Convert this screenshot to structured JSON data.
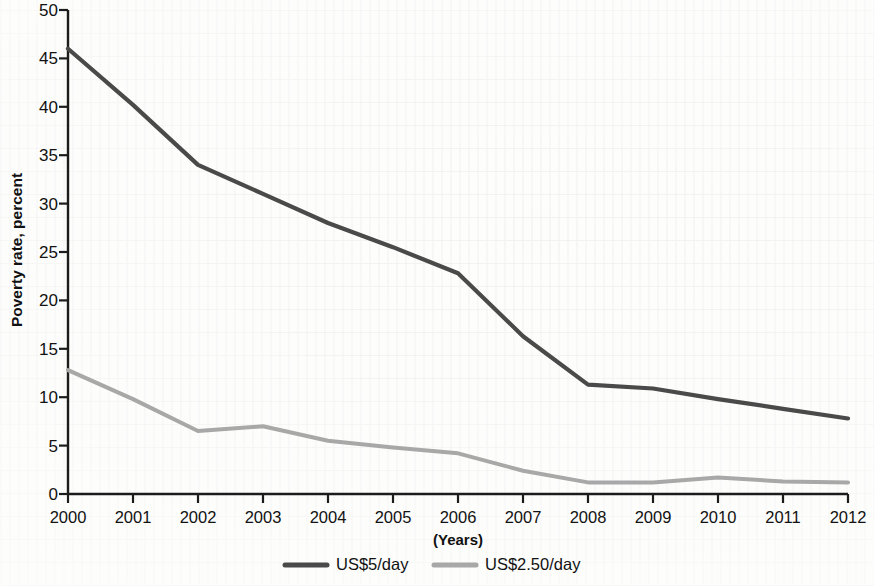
{
  "chart_data": {
    "type": "line",
    "title": "",
    "xlabel": "(Years)",
    "ylabel": "Poverty rate, percent",
    "categories": [
      "2000",
      "2001",
      "2002",
      "2003",
      "2004",
      "2005",
      "2006",
      "2007",
      "2008",
      "2009",
      "2010",
      "2011",
      "2012"
    ],
    "x": [
      2000,
      2001,
      2002,
      2003,
      2004,
      2005,
      2006,
      2007,
      2008,
      2009,
      2010,
      2011,
      2012
    ],
    "xlim": [
      2000,
      2012
    ],
    "ylim": [
      0,
      50
    ],
    "yticks": [
      0,
      5,
      10,
      15,
      20,
      25,
      30,
      35,
      40,
      45,
      50
    ],
    "ytick_labels": [
      "0",
      "5",
      "10",
      "15",
      "20",
      "25",
      "30",
      "35",
      "40",
      "45",
      "50"
    ],
    "grid": false,
    "legend_position": "bottom",
    "series": [
      {
        "name": "US$5/day",
        "color": "#4a4a4a",
        "values": [
          46.0,
          40.2,
          34.0,
          31.0,
          28.0,
          25.5,
          22.8,
          16.3,
          11.3,
          10.9,
          9.8,
          8.8,
          7.8
        ]
      },
      {
        "name": "US$2.50/day",
        "color": "#a8a8a8",
        "values": [
          12.8,
          9.8,
          6.5,
          7.0,
          5.5,
          4.8,
          4.2,
          2.4,
          1.2,
          1.2,
          1.7,
          1.3,
          1.2
        ]
      }
    ]
  },
  "legend": {
    "items": [
      {
        "label": "US$5/day",
        "color": "#4a4a4a"
      },
      {
        "label": "US$2.50/day",
        "color": "#a8a8a8"
      }
    ]
  },
  "axes": {
    "y_title": "Poverty rate, percent",
    "x_title": "(Years)"
  }
}
